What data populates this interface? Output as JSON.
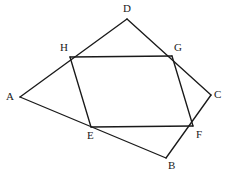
{
  "figure": {
    "canvas": {
      "width": 230,
      "height": 175,
      "background": "#ffffff"
    },
    "stroke_color": "#1a1a1a",
    "stroke_width": 1.35,
    "label_color": "#1a1a1a",
    "label_font_size": 11,
    "points": [
      {
        "id": "A",
        "label": "A",
        "x": 20,
        "y": 97,
        "label_x": 6,
        "label_y": 91
      },
      {
        "id": "B",
        "label": "B",
        "x": 166,
        "y": 158,
        "label_x": 168,
        "label_y": 160
      },
      {
        "id": "C",
        "label": "C",
        "x": 211,
        "y": 95,
        "label_x": 214,
        "label_y": 89
      },
      {
        "id": "D",
        "label": "D",
        "x": 127,
        "y": 19,
        "label_x": 123,
        "label_y": 3
      },
      {
        "id": "E",
        "label": "E",
        "x": 91,
        "y": 127,
        "label_x": 87,
        "label_y": 130
      },
      {
        "id": "F",
        "label": "F",
        "x": 193,
        "y": 126,
        "label_x": 196,
        "label_y": 129
      },
      {
        "id": "G",
        "label": "G",
        "x": 172,
        "y": 56,
        "label_x": 174,
        "label_y": 42
      },
      {
        "id": "H",
        "label": "H",
        "x": 70,
        "y": 57,
        "label_x": 60,
        "label_y": 42
      }
    ],
    "edges": [
      {
        "name": "edge-A-D",
        "from": "A",
        "to": "D"
      },
      {
        "name": "edge-D-C",
        "from": "D",
        "to": "C"
      },
      {
        "name": "edge-C-B",
        "from": "C",
        "to": "B"
      },
      {
        "name": "edge-B-A",
        "from": "B",
        "to": "A"
      },
      {
        "name": "edge-H-G",
        "from": "H",
        "to": "G"
      },
      {
        "name": "edge-G-F",
        "from": "G",
        "to": "F"
      },
      {
        "name": "edge-F-E",
        "from": "F",
        "to": "E"
      },
      {
        "name": "edge-E-H",
        "from": "E",
        "to": "H"
      }
    ]
  }
}
